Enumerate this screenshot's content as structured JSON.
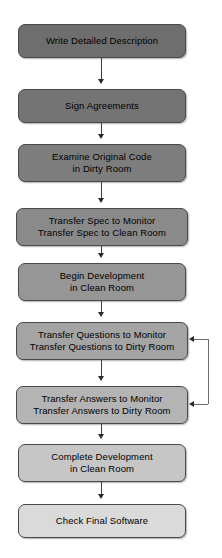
{
  "diagram": {
    "nodes": [
      {
        "id": "write-detailed-description",
        "lines": [
          "Write Detailed Description"
        ],
        "fill": "#6e6e6e",
        "x": 18,
        "y": 24,
        "w": 168,
        "h": 34
      },
      {
        "id": "sign-agreements",
        "lines": [
          "Sign Agreements"
        ],
        "fill": "#747474",
        "x": 18,
        "y": 89,
        "w": 168,
        "h": 34
      },
      {
        "id": "examine-original-code",
        "lines": [
          "Examine Original Code",
          "in Dirty Room"
        ],
        "fill": "#7d7d7d",
        "x": 18,
        "y": 144,
        "w": 168,
        "h": 38
      },
      {
        "id": "transfer-spec",
        "lines": [
          "Transfer Spec to Monitor",
          "Transfer Spec to Clean Room"
        ],
        "fill": "#8a8a8a",
        "x": 16,
        "y": 208,
        "w": 172,
        "h": 38
      },
      {
        "id": "begin-development",
        "lines": [
          "Begin Development",
          "in Clean Room"
        ],
        "fill": "#969696",
        "x": 18,
        "y": 263,
        "w": 168,
        "h": 38
      },
      {
        "id": "transfer-questions",
        "lines": [
          "Transfer Questions to Monitor",
          "Transfer Questions to Dirty Room"
        ],
        "fill": "#a4a4a4",
        "x": 16,
        "y": 322,
        "w": 172,
        "h": 38
      },
      {
        "id": "transfer-answers",
        "lines": [
          "Transfer Answers to Monitor",
          "Transfer Answers to Dirty Room"
        ],
        "fill": "#b4b4b4",
        "x": 16,
        "y": 386,
        "w": 172,
        "h": 38
      },
      {
        "id": "complete-development",
        "lines": [
          "Complete Development",
          "in Clean Room"
        ],
        "fill": "#c6c6c6",
        "x": 18,
        "y": 444,
        "w": 168,
        "h": 38
      },
      {
        "id": "check-final-software",
        "lines": [
          "Check Final Software"
        ],
        "fill": "#dadada",
        "x": 18,
        "y": 504,
        "w": 168,
        "h": 34
      }
    ],
    "connectors": [
      {
        "id": "write-to-sign",
        "x": 101,
        "y1": 58,
        "y2": 84
      },
      {
        "id": "sign-to-examine",
        "x": 101,
        "y1": 123,
        "y2": 139
      },
      {
        "id": "examine-to-spec",
        "x": 101,
        "y1": 182,
        "y2": 203
      },
      {
        "id": "spec-to-begin",
        "x": 101,
        "y1": 246,
        "y2": 258
      },
      {
        "id": "begin-to-questions",
        "x": 101,
        "y1": 301,
        "y2": 317
      },
      {
        "id": "questions-to-answers",
        "x": 101,
        "y1": 360,
        "y2": 381
      },
      {
        "id": "answers-to-complete",
        "x": 101,
        "y1": 424,
        "y2": 439
      },
      {
        "id": "complete-to-check",
        "x": 101,
        "y1": 482,
        "y2": 499
      }
    ],
    "feedback_loop": {
      "id": "answers-to-questions-feedback",
      "right_x": 208,
      "top_y": 339,
      "bottom_y": 404,
      "arrow_target_x": 189
    }
  }
}
